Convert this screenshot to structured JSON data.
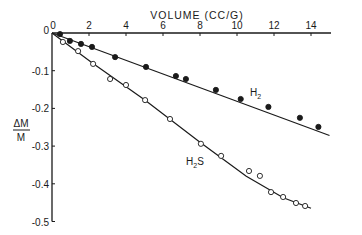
{
  "chart_data": {
    "type": "scatter",
    "title": "",
    "xlabel": "VOLUME (CC/G)",
    "ylabel": "ΔM / M",
    "xlim": [
      0,
      15
    ],
    "ylim": [
      -0.5,
      0
    ],
    "grid": false,
    "legend": "inline labels",
    "x_axis_position": "top",
    "x_ticks": [
      0,
      2,
      4,
      6,
      8,
      10,
      12,
      14
    ],
    "x_tick_labels": [
      "0",
      "2",
      "4",
      "6",
      "8",
      "10",
      "12",
      "14"
    ],
    "y_ticks": [
      0,
      -0.1,
      -0.2,
      -0.3,
      -0.4,
      -0.5
    ],
    "y_tick_labels": [
      "0",
      "-0.1",
      "-0.2",
      "-0.3",
      "-0.4",
      "-0.5"
    ],
    "series": [
      {
        "name": "H2",
        "label_main": "H",
        "label_sub": "2",
        "marker": "filled-circle",
        "fit": "linear",
        "fit_line": [
          [
            0,
            0
          ],
          [
            15.0,
            -0.272
          ]
        ],
        "x": [
          0.43,
          0.97,
          1.57,
          2.16,
          3.41,
          5.08,
          6.7,
          7.24,
          8.86,
          10.2,
          11.7,
          13.4,
          14.4
        ],
        "y": [
          -0.003,
          -0.021,
          -0.029,
          -0.037,
          -0.064,
          -0.09,
          -0.114,
          -0.122,
          -0.151,
          -0.175,
          -0.196,
          -0.225,
          -0.249
        ]
      },
      {
        "name": "H2S",
        "label_main": "H",
        "label_sub": "2",
        "label_tail": "S",
        "marker": "open-circle",
        "fit": "curve",
        "fit_line": [
          [
            0,
            0
          ],
          [
            2.2,
            -0.08
          ],
          [
            5.0,
            -0.177
          ],
          [
            8.0,
            -0.29
          ],
          [
            10.5,
            -0.38
          ],
          [
            12.5,
            -0.437
          ],
          [
            14.0,
            -0.465
          ]
        ],
        "x": [
          0.59,
          1.41,
          2.22,
          3.14,
          4.0,
          5.03,
          6.38,
          8.05,
          9.14,
          10.65,
          11.24,
          11.84,
          12.49,
          13.19,
          13.68
        ],
        "y": [
          -0.024,
          -0.048,
          -0.082,
          -0.122,
          -0.138,
          -0.178,
          -0.228,
          -0.294,
          -0.326,
          -0.366,
          -0.379,
          -0.422,
          -0.435,
          -0.451,
          -0.459
        ]
      }
    ]
  },
  "labels": {
    "xlabel": "VOLUME (CC/G)",
    "ylabel_num": "ΔM",
    "ylabel_den": "M",
    "origin_x": "0",
    "origin_y": "0"
  }
}
